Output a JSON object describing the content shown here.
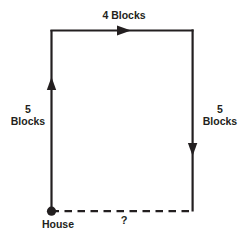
{
  "figure": {
    "background_color": "#ffffff",
    "stroke_color": "#231f20",
    "labels": {
      "top": "4 Blocks",
      "left_value": "5",
      "left_unit": "Blocks",
      "right_value": "5",
      "right_unit": "Blocks",
      "origin": "House",
      "unknown": "?"
    },
    "segments": [
      {
        "name": "left-side",
        "style": "solid",
        "direction": "up",
        "length_label": "5 Blocks",
        "from": [
          51,
          211
        ],
        "to": [
          51,
          30
        ]
      },
      {
        "name": "top-side",
        "style": "solid",
        "direction": "right",
        "length_label": "4 Blocks",
        "from": [
          51,
          30
        ],
        "to": [
          193,
          30
        ]
      },
      {
        "name": "right-side",
        "style": "solid",
        "direction": "down",
        "length_label": "5 Blocks",
        "from": [
          193,
          30
        ],
        "to": [
          193,
          211
        ]
      },
      {
        "name": "bottom-side",
        "style": "dashed",
        "direction": "none",
        "length_label": "?",
        "from": [
          51,
          211
        ],
        "to": [
          193,
          211
        ]
      }
    ],
    "point": {
      "name": "house-point",
      "x": 51,
      "y": 211,
      "radius": 4.5
    }
  }
}
